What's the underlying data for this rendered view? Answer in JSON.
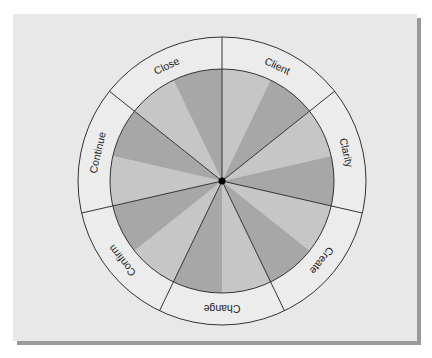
{
  "diagram": {
    "type": "wheel",
    "center": {
      "x": 222,
      "y": 181
    },
    "outer_radius": 144,
    "inner_radius": 112,
    "hub_radius": 3.5,
    "segments": [
      {
        "label": "Client"
      },
      {
        "label": "Clarity"
      },
      {
        "label": "Create"
      },
      {
        "label": "Change"
      },
      {
        "label": "Confirm"
      },
      {
        "label": "Continue"
      },
      {
        "label": "Close"
      }
    ]
  },
  "colors": {
    "panel": "#e8e8e8",
    "shadow": "#9a9a9a",
    "ring": "#ececec",
    "wedge_light": "#c6c6c6",
    "wedge_dark": "#a7a7a7",
    "line": "#333333",
    "hub": "#000000",
    "text": "#222222"
  }
}
